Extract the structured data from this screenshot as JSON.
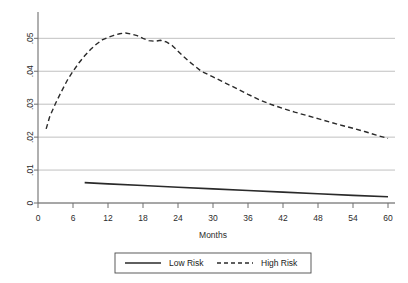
{
  "chart_data": {
    "type": "line",
    "title": "",
    "xlabel": "Months",
    "ylabel": "",
    "xlim": [
      0,
      60
    ],
    "ylim": [
      0,
      0.055
    ],
    "xticks": [
      0,
      6,
      12,
      18,
      24,
      30,
      36,
      42,
      48,
      54,
      60
    ],
    "xticklabels": [
      "0",
      "6",
      "12",
      "18",
      "24",
      "30",
      "36",
      "42",
      "48",
      "54",
      "60"
    ],
    "yticks": [
      0,
      0.01,
      0.02,
      0.03,
      0.04,
      0.05
    ],
    "yticklabels": [
      "0",
      ".01",
      ".02",
      ".03",
      ".04",
      ".05"
    ],
    "grid": "horizontal",
    "legend_position": "below-center",
    "series": [
      {
        "name": "Low Risk",
        "style": "solid",
        "color": "#2a2a2a",
        "x": [
          8,
          12,
          18,
          24,
          30,
          36,
          42,
          48,
          54,
          60
        ],
        "values": [
          0.0062,
          0.0058,
          0.0053,
          0.0048,
          0.0043,
          0.0038,
          0.0033,
          0.0028,
          0.0023,
          0.0019
        ]
      },
      {
        "name": "High Risk",
        "style": "dashed",
        "color": "#2a2a2a",
        "x": [
          1.4,
          2,
          3,
          4,
          5,
          6,
          7,
          8,
          9,
          10,
          11,
          12,
          13,
          14,
          15,
          16,
          17,
          18,
          19,
          20,
          21,
          22,
          23,
          24,
          25,
          26,
          27,
          28,
          30,
          32,
          34,
          36,
          38,
          40,
          42,
          44,
          46,
          48,
          50,
          52,
          54,
          56,
          58,
          60
        ],
        "values": [
          0.0225,
          0.0262,
          0.0302,
          0.0338,
          0.0372,
          0.04,
          0.0425,
          0.0447,
          0.0466,
          0.0482,
          0.0495,
          0.0503,
          0.0509,
          0.0514,
          0.0516,
          0.0513,
          0.0508,
          0.05,
          0.0493,
          0.0491,
          0.0494,
          0.0489,
          0.0478,
          0.0461,
          0.0444,
          0.0428,
          0.0414,
          0.04,
          0.0383,
          0.0365,
          0.0348,
          0.033,
          0.0313,
          0.0299,
          0.0287,
          0.0276,
          0.0266,
          0.0256,
          0.0246,
          0.0236,
          0.0227,
          0.0217,
          0.0206,
          0.0196
        ]
      }
    ]
  },
  "legend": {
    "entries": [
      {
        "label": "Low Risk",
        "style": "solid"
      },
      {
        "label": "High Risk",
        "style": "dashed"
      }
    ]
  }
}
